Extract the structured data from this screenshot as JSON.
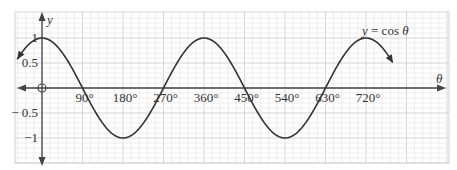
{
  "chart_data": {
    "type": "line",
    "title": "",
    "function_label": "y = cos θ",
    "xlabel": "θ",
    "ylabel": "y",
    "x_unit": "degrees",
    "xlim": [
      -60,
      790
    ],
    "ylim": [
      -1.35,
      1.45
    ],
    "x_ticks": [
      {
        "value": 90,
        "label": "90°"
      },
      {
        "value": 180,
        "label": "180°"
      },
      {
        "value": 270,
        "label": "270°"
      },
      {
        "value": 360,
        "label": "360°"
      },
      {
        "value": 450,
        "label": "450°"
      },
      {
        "value": 540,
        "label": "540°"
      },
      {
        "value": 630,
        "label": "630°"
      },
      {
        "value": 720,
        "label": "720°"
      }
    ],
    "y_ticks": [
      {
        "value": 1,
        "label": "1"
      },
      {
        "value": 0.5,
        "label": "0.5"
      },
      {
        "value": -0.5,
        "label": "− 0.5"
      },
      {
        "value": -1,
        "label": "−1"
      }
    ],
    "origin_label": "O",
    "grid": true,
    "series": [
      {
        "name": "y = cos θ",
        "x_range": [
          -55,
          780
        ],
        "function": "cos",
        "color": "#333333"
      }
    ],
    "key_points": [
      {
        "x": 0,
        "y": 1
      },
      {
        "x": 90,
        "y": 0
      },
      {
        "x": 180,
        "y": -1
      },
      {
        "x": 270,
        "y": 0
      },
      {
        "x": 360,
        "y": 1
      },
      {
        "x": 450,
        "y": 0
      },
      {
        "x": 540,
        "y": -1
      },
      {
        "x": 630,
        "y": 0
      },
      {
        "x": 720,
        "y": 1
      }
    ]
  },
  "colors": {
    "curve": "#333333",
    "axis": "#444444",
    "grid_major": "#d4d4d4",
    "grid_minor": "#ececec"
  }
}
